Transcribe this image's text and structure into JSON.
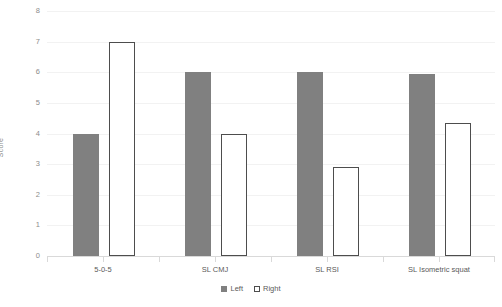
{
  "chart_data": {
    "type": "bar",
    "title": "",
    "xlabel": "",
    "ylabel": "Score",
    "ylim": [
      0,
      8
    ],
    "yticks": [
      0,
      1,
      2,
      3,
      4,
      5,
      6,
      7,
      8
    ],
    "ytick_labels": [
      "0",
      "1",
      "2",
      "3",
      "4",
      "5",
      "6",
      "7",
      "8"
    ],
    "grid": true,
    "legend_position": "bottom-center",
    "categories": [
      "5-0-5",
      "SL CMJ",
      "SL RSI",
      "SL Isometric squat"
    ],
    "series": [
      {
        "name": "Left",
        "values": [
          4,
          6,
          6,
          5.93
        ],
        "color": "#808080",
        "style": "filled"
      },
      {
        "name": "Right",
        "values": [
          7,
          4,
          2.9,
          4.35
        ],
        "color": "#ffffff",
        "style": "outlined",
        "edge_color": "#4d4d4d"
      }
    ]
  },
  "legend": {
    "items": [
      {
        "label": "Left"
      },
      {
        "label": "Right"
      }
    ]
  },
  "colors": {
    "bar_fill": "#808080",
    "bar_outline": "#4d4d4d",
    "gridline": "#f2f2f2",
    "axis": "#d9d9d9",
    "tick_text": "#8c8c8c",
    "category_text": "#5a5a5a"
  }
}
